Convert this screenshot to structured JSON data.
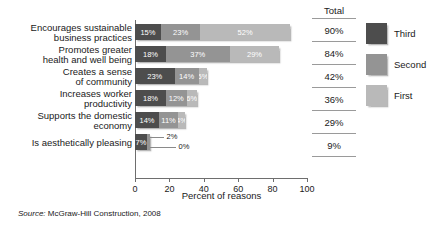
{
  "chart_data": {
    "type": "bar",
    "orientation": "horizontal",
    "stacked": true,
    "title": "",
    "xlabel": "Percent of reasons",
    "ylabel": "",
    "xlim": [
      0,
      100
    ],
    "xticks": [
      0,
      20,
      40,
      60,
      80,
      100
    ],
    "grid": false,
    "legend_position": "right",
    "categories": [
      "Encourages sustainable business practices",
      "Promotes greater health and well being",
      "Creates a sense of community",
      "Increases worker productivity",
      "Supports the domestic economy",
      "Is aesthetically pleasing"
    ],
    "category_lines": [
      [
        "Encourages sustainable",
        "business practices"
      ],
      [
        "Promotes greater",
        "health and well being"
      ],
      [
        "Creates a sense",
        "of community"
      ],
      [
        "Increases worker",
        "productivity"
      ],
      [
        "Supports the domestic",
        "economy"
      ],
      [
        "Is aesthetically pleasing"
      ]
    ],
    "series": [
      {
        "name": "Third",
        "color": "#4d4d4d",
        "values": [
          15,
          18,
          23,
          18,
          14,
          7
        ]
      },
      {
        "name": "Second",
        "color": "#949494",
        "values": [
          23,
          37,
          14,
          12,
          11,
          2
        ]
      },
      {
        "name": "First",
        "color": "#b9b9b9",
        "values": [
          52,
          29,
          5,
          6,
          4,
          0
        ]
      }
    ],
    "segment_labels": [
      [
        "15%",
        "23%",
        "52%"
      ],
      [
        "18%",
        "37%",
        "29%"
      ],
      [
        "23%",
        "14%",
        "5%"
      ],
      [
        "18%",
        "12%",
        "6%"
      ],
      [
        "14%",
        "11%",
        "4%"
      ],
      [
        "7%",
        "2%",
        "0%"
      ]
    ],
    "totals": [
      "90%",
      "84%",
      "42%",
      "36%",
      "29%",
      "9%"
    ],
    "total_header": "Total",
    "annotations": [
      {
        "text": "2%",
        "note": "leader line from second segment of last bar"
      },
      {
        "text": "0%",
        "note": "leader line from third segment of last bar"
      }
    ],
    "source": {
      "prefix": "Source:",
      "text": "McGraw-Hill Construction, 2008"
    }
  }
}
